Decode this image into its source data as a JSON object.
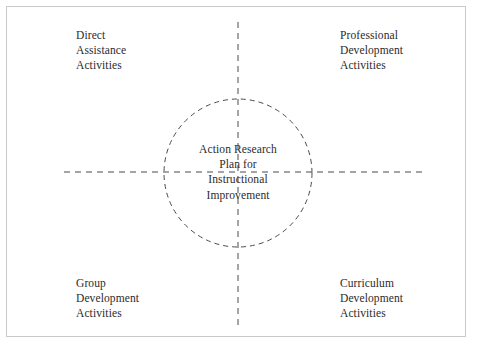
{
  "diagram": {
    "type": "quadrant-circle-diagram",
    "title": "Action Research Plan for Instructional Improvement",
    "center": {
      "name": "center-node",
      "text": "Action Research\nPlan for\nInstructional\nImprovement",
      "lines": [
        "Action Research",
        "Plan for",
        "Instructional",
        "Improvement"
      ]
    },
    "quadrants": [
      {
        "position": "top-left",
        "name": "quadrant-direct-assistance",
        "text": "Direct\nAssistance\nActivities",
        "lines": [
          "Direct",
          "Assistance",
          "Activities"
        ]
      },
      {
        "position": "top-right",
        "name": "quadrant-professional-development",
        "text": "Professional\nDevelopment\nActivities",
        "lines": [
          "Professional",
          "Development",
          "Activities"
        ]
      },
      {
        "position": "bottom-left",
        "name": "quadrant-group-development",
        "text": "Group\nDevelopment\nActivities",
        "lines": [
          "Group",
          "Development",
          "Activities"
        ]
      },
      {
        "position": "bottom-right",
        "name": "quadrant-curriculum-development",
        "text": "Curriculum\nDevelopment\nActivities",
        "lines": [
          "Curriculum",
          "Development",
          "Activities"
        ]
      }
    ],
    "geometry": {
      "circle_center_x": 238,
      "circle_center_y": 173,
      "circle_radius": 74,
      "vertical_axis_x": 238,
      "vertical_axis_y_start": 22,
      "vertical_axis_y_end": 325,
      "horizontal_axis_y": 172,
      "horizontal_axis_x_start": 64,
      "horizontal_axis_x_end": 425
    },
    "colors": {
      "background": "#ffffff",
      "frame_border": "#c9c9c9",
      "stroke": "#4a4a4a",
      "text": "#2b2b2b"
    }
  }
}
